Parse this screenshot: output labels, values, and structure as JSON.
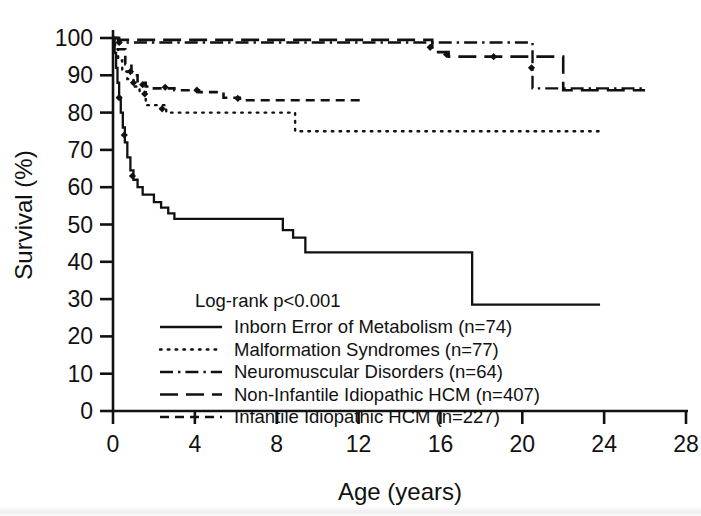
{
  "figure": {
    "xlabel": "Age (years)",
    "ylabel": "Survival (%)",
    "annotation": "Log-rank p<0.001"
  },
  "axes": {
    "x_ticks": [
      "0",
      "4",
      "8",
      "12",
      "16",
      "20",
      "24",
      "28"
    ],
    "y_ticks": [
      "0",
      "10",
      "20",
      "30",
      "40",
      "50",
      "60",
      "70",
      "80",
      "90",
      "100"
    ]
  },
  "legend": {
    "items": [
      {
        "label": "Inborn Error of Metabolism (n=74)",
        "style": "solid"
      },
      {
        "label": "Malformation Syndromes (n=77)",
        "style": "dotted"
      },
      {
        "label": "Neuromuscular Disorders (n=64)",
        "style": "dashdot"
      },
      {
        "label": "Non-Infantile Idiopathic HCM (n=407)",
        "style": "longdash"
      },
      {
        "label": "Infantile Idiopathic HCM (n=227)",
        "style": "shortdash"
      }
    ]
  },
  "chart_data": {
    "type": "line",
    "subtype": "kaplan-meier-survival",
    "title": "",
    "xlabel": "Age (years)",
    "ylabel": "Survival (%)",
    "xlim": [
      0,
      28
    ],
    "ylim": [
      0,
      100
    ],
    "xticks": [
      0,
      4,
      8,
      12,
      16,
      20,
      24,
      28
    ],
    "yticks": [
      0,
      10,
      20,
      30,
      40,
      50,
      60,
      70,
      80,
      90,
      100
    ],
    "grid": false,
    "legend_position": "inside-lower-left",
    "annotations": [
      "Log-rank p<0.001"
    ],
    "series": [
      {
        "name": "Inborn Error of Metabolism (n=74)",
        "n": 74,
        "style": "solid",
        "steps": [
          [
            0.0,
            100.0
          ],
          [
            0.08,
            96.0
          ],
          [
            0.15,
            92.0
          ],
          [
            0.22,
            88.0
          ],
          [
            0.3,
            84.0
          ],
          [
            0.38,
            80.0
          ],
          [
            0.48,
            76.0
          ],
          [
            0.58,
            72.0
          ],
          [
            0.7,
            68.0
          ],
          [
            0.85,
            64.5
          ],
          [
            1.0,
            62.0
          ],
          [
            1.2,
            60.0
          ],
          [
            1.45,
            58.0
          ],
          [
            1.8,
            58.0
          ],
          [
            2.0,
            56.0
          ],
          [
            2.35,
            54.5
          ],
          [
            2.7,
            53.0
          ],
          [
            3.0,
            51.5
          ],
          [
            8.0,
            51.5
          ],
          [
            8.3,
            48.5
          ],
          [
            8.8,
            46.5
          ],
          [
            9.4,
            42.5
          ],
          [
            17.45,
            42.5
          ],
          [
            17.55,
            28.5
          ],
          [
            23.8,
            28.5
          ]
        ],
        "censor_marks": [
          [
            0.3,
            84.0
          ],
          [
            0.55,
            74.0
          ],
          [
            0.95,
            63.0
          ]
        ]
      },
      {
        "name": "Malformation Syndromes (n=77)",
        "n": 77,
        "style": "dotted",
        "steps": [
          [
            0.0,
            100.0
          ],
          [
            0.1,
            97.0
          ],
          [
            0.25,
            94.0
          ],
          [
            0.45,
            91.0
          ],
          [
            0.7,
            89.0
          ],
          [
            1.0,
            87.0
          ],
          [
            1.3,
            85.5
          ],
          [
            1.6,
            82.0
          ],
          [
            2.2,
            82.0
          ],
          [
            2.6,
            80.0
          ],
          [
            8.8,
            80.0
          ],
          [
            8.9,
            75.0
          ],
          [
            23.8,
            75.0
          ]
        ],
        "censor_marks": [
          [
            1.0,
            88.0
          ],
          [
            1.55,
            85.0
          ],
          [
            2.4,
            81.0
          ]
        ]
      },
      {
        "name": "Neuromuscular Disorders (n=64)",
        "n": 64,
        "style": "dashdot",
        "steps": [
          [
            0.0,
            100.0
          ],
          [
            0.25,
            98.8
          ],
          [
            20.4,
            98.8
          ],
          [
            20.5,
            86.5
          ],
          [
            26.0,
            86.5
          ]
        ],
        "censor_marks": [
          [
            0.3,
            98.8
          ],
          [
            20.45,
            92.0
          ]
        ]
      },
      {
        "name": "Non-Infantile Idiopathic HCM (n=407)",
        "n": 407,
        "style": "longdash",
        "steps": [
          [
            0.0,
            100.0
          ],
          [
            0.3,
            99.5
          ],
          [
            15.4,
            99.5
          ],
          [
            15.6,
            96.2
          ],
          [
            16.2,
            96.2
          ],
          [
            16.4,
            95.0
          ],
          [
            21.9,
            95.0
          ],
          [
            22.0,
            86.0
          ],
          [
            26.0,
            86.0
          ]
        ],
        "censor_marks": [
          [
            15.5,
            97.5
          ],
          [
            16.3,
            95.6
          ],
          [
            18.6,
            95.0
          ]
        ]
      },
      {
        "name": "Infantile Idiopathic HCM (n=227)",
        "n": 227,
        "style": "shortdash",
        "steps": [
          [
            0.0,
            100.0
          ],
          [
            0.25,
            97.0
          ],
          [
            0.6,
            93.0
          ],
          [
            0.9,
            90.0
          ],
          [
            1.2,
            88.0
          ],
          [
            1.6,
            87.0
          ],
          [
            2.0,
            86.5
          ],
          [
            2.6,
            86.5
          ],
          [
            3.0,
            86.0
          ],
          [
            4.2,
            85.5
          ],
          [
            5.4,
            84.0
          ],
          [
            6.2,
            83.3
          ],
          [
            12.3,
            83.3
          ]
        ],
        "censor_marks": [
          [
            0.85,
            91.0
          ],
          [
            1.45,
            87.5
          ],
          [
            2.55,
            86.8
          ],
          [
            4.1,
            86.0
          ],
          [
            6.1,
            83.8
          ]
        ]
      }
    ]
  }
}
